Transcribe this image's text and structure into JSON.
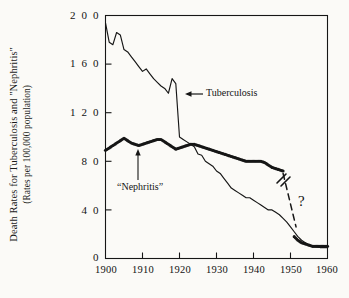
{
  "figure": {
    "background_color": "#fbfaf7",
    "ink_color": "#161616",
    "axis_label_y_line1": "Death Rates for Tuberculosis and \"Nephritis\"",
    "axis_label_y_line2": "(Rates per 100,000 population)"
  },
  "annotations": {
    "tuberculosis_label": "Tuberculosis",
    "nephritis_label": "“Nephritis”",
    "question_mark": "?"
  },
  "chart_data": {
    "type": "line",
    "title": "",
    "subtitle": "",
    "xlabel": "",
    "ylabel": "Death Rates for Tuberculosis and \"Nephritis\" (Rates per 100,000 population)",
    "xlim": [
      1900,
      1960
    ],
    "ylim": [
      0,
      200
    ],
    "xticks": [
      1900,
      1910,
      1920,
      1930,
      1940,
      1950,
      1960
    ],
    "xtick_labels": [
      "1900",
      "1910",
      "1920",
      "1930",
      "1940",
      "1950",
      "1960"
    ],
    "yticks": [
      0,
      40,
      80,
      120,
      160,
      200
    ],
    "ytick_labels": [
      "0",
      "4 0",
      "8 0",
      "1 2 0",
      "1 6 0",
      "2 0 0"
    ],
    "grid": false,
    "legend": "none (series labeled inline with arrows)",
    "frame": "box",
    "series": [
      {
        "name": "Tuberculosis",
        "style": "solid-line",
        "color": "#161616",
        "label_position": {
          "x": 1926,
          "y": 140,
          "arrow": "left-pointing"
        },
        "x": [
          1900,
          1901,
          1902,
          1903,
          1904,
          1905,
          1906,
          1907,
          1908,
          1909,
          1910,
          1911,
          1912,
          1913,
          1914,
          1915,
          1916,
          1917,
          1918,
          1919,
          1920,
          1921,
          1922,
          1923,
          1924,
          1925,
          1926,
          1927,
          1928,
          1929,
          1930,
          1931,
          1932,
          1933,
          1934,
          1935,
          1936,
          1937,
          1938,
          1939,
          1940,
          1941,
          1942,
          1943,
          1944,
          1945,
          1946,
          1947,
          1948,
          1949,
          1950,
          1951,
          1952,
          1953,
          1954,
          1955,
          1956,
          1957,
          1958,
          1959,
          1960
        ],
        "values": [
          194,
          178,
          176,
          186,
          184,
          172,
          170,
          166,
          162,
          158,
          154,
          156,
          152,
          148,
          145,
          142,
          140,
          136,
          148,
          144,
          100,
          98,
          96,
          94,
          92,
          86,
          85,
          80,
          78,
          76,
          72,
          70,
          66,
          62,
          58,
          56,
          54,
          52,
          50,
          50,
          48,
          46,
          44,
          42,
          40,
          40,
          38,
          36,
          33,
          30,
          26,
          22,
          18,
          15,
          13,
          11,
          10,
          10,
          9,
          9,
          9
        ]
      },
      {
        "name": "\"Nephritis\"",
        "style": "dotted-line",
        "color": "#161616",
        "label_position": {
          "x": 1907,
          "y": 62,
          "arrow": "up-pointing"
        },
        "x": [
          1900,
          1901,
          1902,
          1903,
          1904,
          1905,
          1906,
          1907,
          1908,
          1909,
          1910,
          1911,
          1912,
          1913,
          1914,
          1915,
          1916,
          1917,
          1918,
          1919,
          1920,
          1921,
          1922,
          1923,
          1924,
          1925,
          1926,
          1927,
          1928,
          1929,
          1930,
          1931,
          1932,
          1933,
          1934,
          1935,
          1936,
          1937,
          1938,
          1939,
          1940,
          1941,
          1942,
          1943,
          1944,
          1945,
          1946,
          1947,
          1948,
          1949,
          1950,
          1951,
          1952,
          1953,
          1954,
          1955,
          1956,
          1957,
          1958,
          1959,
          1960
        ],
        "values": [
          89,
          91,
          93,
          95,
          97,
          99,
          97,
          95,
          94,
          93,
          94,
          95,
          96,
          97,
          98,
          98,
          96,
          94,
          92,
          90,
          91,
          92,
          93,
          94,
          94,
          93,
          92,
          91,
          90,
          89,
          88,
          87,
          86,
          85,
          84,
          83,
          82,
          81,
          80,
          80,
          80,
          80,
          80,
          79,
          77,
          75,
          74,
          73,
          72,
          null,
          null,
          18,
          15,
          13,
          12,
          11,
          10,
          10,
          10,
          10,
          10
        ],
        "break_note": "series interrupted after 1948; dashed connector with '?' bridges 1948–1951"
      },
      {
        "name": "uncertain-connector",
        "style": "dashed-line-with-break-marks",
        "color": "#161616",
        "x": [
          1948,
          1951.5
        ],
        "values": [
          70,
          26
        ],
        "note": "dashed line with double-slash break symbol and '?' annotation indicating classification discontinuity"
      }
    ]
  }
}
